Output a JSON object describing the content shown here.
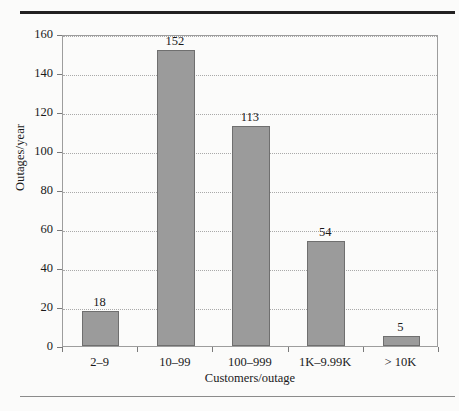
{
  "figure": {
    "background_color": "#fbfbfa",
    "rule_color_top": "#222121",
    "rule_color_bottom": "#8b8b8b",
    "bar_fill_color": "#9b9b9b",
    "bar_border_color": "#6f6f6f",
    "axis_color": "#9d9d9d",
    "grid_color": "#a9a9a9"
  },
  "chart_data": {
    "type": "bar",
    "title": "",
    "xlabel": "Customers/outage",
    "ylabel": "Outages/year",
    "categories": [
      "2–9",
      "10–99",
      "100–999",
      "1K–9.99K",
      "> 10K"
    ],
    "values": [
      18,
      152,
      113,
      54,
      5
    ],
    "value_labels": [
      "18",
      "152",
      "113",
      "54",
      "5"
    ],
    "ylim": [
      0,
      160
    ],
    "ytick_values": [
      0,
      20,
      40,
      60,
      80,
      100,
      120,
      140,
      160
    ],
    "ytick_labels": [
      "0",
      "20",
      "40",
      "60",
      "80",
      "100",
      "120",
      "140",
      "160"
    ],
    "grid": "horizontal-dotted",
    "legend": "none",
    "bar_width_fraction": 0.5
  }
}
